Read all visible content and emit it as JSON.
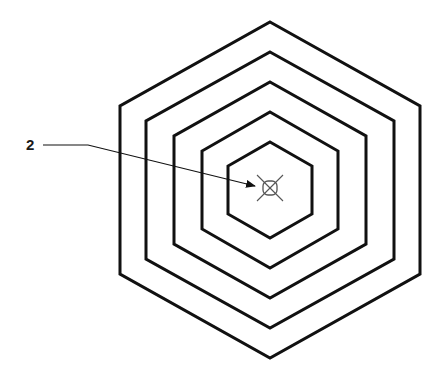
{
  "diagram": {
    "type": "concentric-hexagons",
    "center": [
      270,
      190
    ],
    "stroke_color": "#111111",
    "rings": [
      {
        "name": "hexagon-ring-1",
        "half_width": 150,
        "half_height": 168
      },
      {
        "name": "hexagon-ring-2",
        "half_width": 124,
        "half_height": 138
      },
      {
        "name": "hexagon-ring-3",
        "half_width": 96,
        "half_height": 108
      },
      {
        "name": "hexagon-ring-4",
        "half_width": 68,
        "half_height": 78
      },
      {
        "name": "hexagon-ring-5",
        "half_width": 42,
        "half_height": 48
      }
    ],
    "center_marker": {
      "icon": "crossed-circle-marker-icon",
      "center": [
        270,
        188
      ],
      "size": 14
    },
    "callout": {
      "label": "2",
      "label_pos": [
        26,
        137
      ],
      "leader": [
        [
          43,
          145
        ],
        [
          88,
          145
        ],
        [
          255,
          186
        ]
      ]
    }
  }
}
